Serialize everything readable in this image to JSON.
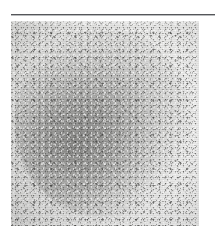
{
  "page": {
    "background_color": "#ffffff",
    "width": 223,
    "height": 226
  },
  "rule": {
    "name": "horizontal-rule",
    "color": "#55575a",
    "shadow_color": "#b9bbbd"
  },
  "figure": {
    "caption": "",
    "alt": "Grayscale micrograph of a roughly circular granular aggregate",
    "panel_background": "#d6d6d4",
    "tone_dark": "#606060",
    "tone_mid": "#a8a8a6",
    "tone_light": "#f2f2f0"
  }
}
